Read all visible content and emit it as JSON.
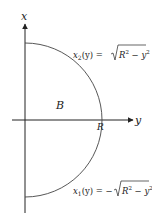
{
  "diagram": {
    "axes": {
      "vertical_label": "x",
      "horizontal_label": "y"
    },
    "region_label": "B",
    "radius_label": "R",
    "upper_curve": {
      "func": "x",
      "sub": "2",
      "arg": "(y) = ",
      "radicand_R": "R",
      "radicand_exp1": "2",
      "radicand_mid": " − ",
      "radicand_y": "y",
      "radicand_exp2": "2"
    },
    "lower_curve": {
      "func": "x",
      "sub": "1",
      "arg": "(y) = −",
      "radicand_R": "R",
      "radicand_exp1": "2",
      "radicand_mid": " − ",
      "radicand_y": "y",
      "radicand_exp2": "2"
    },
    "colors": {
      "axis": "#222222",
      "curve": "#444444",
      "text": "#222222"
    }
  }
}
